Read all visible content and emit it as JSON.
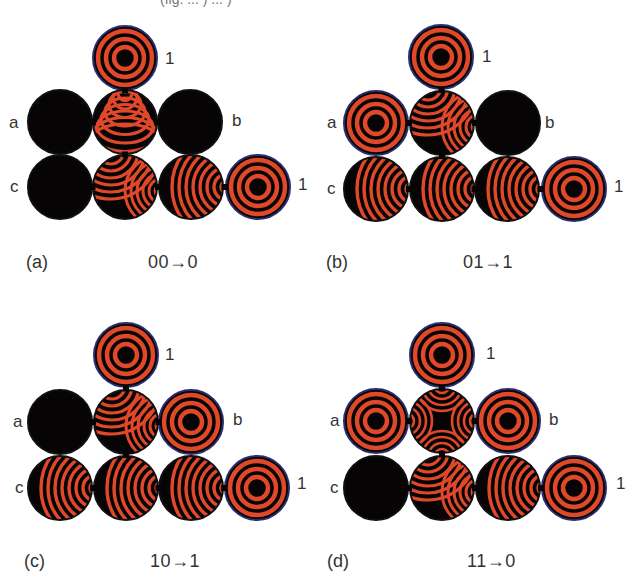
{
  "figure": {
    "colors": {
      "wave_red": "#e0482a",
      "background_dark": "#060404",
      "rim_blue": "#2b2d6e",
      "text": "#333333"
    },
    "cutoff_top_text": "(fig. ... ) ... )",
    "panels": [
      {
        "id": "a",
        "caption_letter": "(a)",
        "caption_logic": "00→0",
        "input_a": "0",
        "input_b": "0",
        "output": "0",
        "labels": {
          "a": "a",
          "b": "b",
          "c": "c",
          "top_out": "1",
          "right_out": "1"
        },
        "cells": {
          "top": "target",
          "a": "dark",
          "mid": "wave-down",
          "b": "dark",
          "c": "dark",
          "bottom_mid": "wave-split",
          "bottom_right": "wave-right",
          "out": "target"
        }
      },
      {
        "id": "b",
        "caption_letter": "(b)",
        "caption_logic": "01→1",
        "input_a": "0",
        "input_b": "1",
        "output": "1",
        "labels": {
          "a": "a",
          "b": "b",
          "c": "c",
          "top_out": "1",
          "right_out": "1"
        },
        "cells": {
          "top": "target",
          "a": "target",
          "mid": "wave-split",
          "b": "dark",
          "c": "wave-right",
          "bottom_mid": "wave-right",
          "bottom_right": "wave-right",
          "out": "target"
        }
      },
      {
        "id": "c",
        "caption_letter": "(c)",
        "caption_logic": "10→1",
        "input_a": "1",
        "input_b": "0",
        "output": "1",
        "labels": {
          "a": "a",
          "b": "b",
          "c": "c",
          "top_out": "1",
          "right_out": "1"
        },
        "cells": {
          "top": "target",
          "a": "dark",
          "mid": "wave-split",
          "b": "target",
          "c": "wave-right",
          "bottom_mid": "wave-right",
          "bottom_right": "wave-right",
          "out": "target"
        }
      },
      {
        "id": "d",
        "caption_letter": "(d)",
        "caption_logic": "11→0",
        "input_a": "1",
        "input_b": "1",
        "output": "0",
        "labels": {
          "a": "a",
          "b": "b",
          "c": "c",
          "top_out": "1",
          "right_out": "1"
        },
        "cells": {
          "top": "target",
          "a": "target",
          "mid": "wave-cross",
          "b": "target",
          "c": "dark",
          "bottom_mid": "wave-split",
          "bottom_right": "wave-right",
          "out": "target"
        }
      }
    ]
  }
}
